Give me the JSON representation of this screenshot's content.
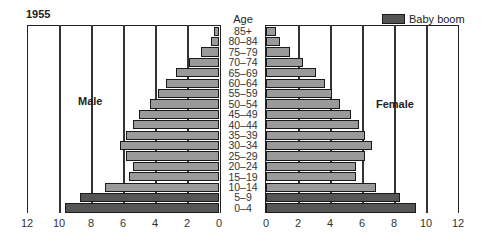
{
  "chart_data": {
    "type": "bar",
    "subtype": "population-pyramid",
    "title": "1955",
    "center_label": "Age",
    "categories": [
      "85+",
      "80–84",
      "75–79",
      "70–74",
      "65–69",
      "60–64",
      "55–59",
      "50–54",
      "45–49",
      "40–44",
      "35–39",
      "30–34",
      "25–29",
      "20–24",
      "15–19",
      "10–14",
      "5–9",
      "0–4"
    ],
    "series": [
      {
        "name": "Male",
        "values": [
          0.3,
          0.5,
          1.1,
          1.9,
          2.7,
          3.3,
          3.8,
          4.3,
          5.0,
          5.4,
          5.8,
          6.2,
          5.8,
          5.4,
          5.6,
          7.1,
          8.7,
          9.6
        ]
      },
      {
        "name": "Female",
        "values": [
          0.6,
          0.9,
          1.5,
          2.3,
          3.1,
          3.7,
          4.1,
          4.6,
          5.3,
          5.8,
          6.2,
          6.6,
          6.2,
          5.6,
          5.6,
          6.9,
          8.4,
          9.4
        ]
      }
    ],
    "highlight": {
      "label": "Baby boom",
      "categories": [
        "5–9",
        "0–4"
      ]
    },
    "x_ticks_male": [
      "12",
      "10",
      "8",
      "6",
      "4",
      "2",
      "0"
    ],
    "x_ticks_female": [
      "0",
      "2",
      "4",
      "6",
      "8",
      "10",
      "12"
    ],
    "xlim": [
      0,
      12
    ],
    "grid": true,
    "legend_position": "top-right",
    "colors": {
      "normal": "#9a9a9a",
      "baby_boom": "#555555",
      "border": "#1a1a1a"
    }
  },
  "labels": {
    "male": "Male",
    "female": "Female",
    "legend": "Baby boom",
    "title": "1955",
    "age": "Age"
  }
}
